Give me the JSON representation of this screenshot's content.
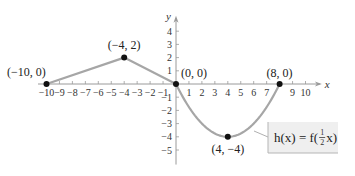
{
  "chart_data": {
    "type": "line",
    "title": "",
    "xlabel": "x",
    "ylabel": "y",
    "xlim": [
      -10.5,
      10.8
    ],
    "ylim": [
      -5.8,
      4.8
    ],
    "x_ticks": [
      -10,
      -9,
      -8,
      -7,
      -6,
      -5,
      -4,
      -3,
      -2,
      -1,
      1,
      2,
      3,
      4,
      5,
      6,
      7,
      9,
      10
    ],
    "x_tick_labels": [
      "−10",
      "−9",
      "−8",
      "−7",
      "−6",
      "−5",
      "−4",
      "−3",
      "−2",
      "−1",
      "1",
      "2",
      "3",
      "4",
      "5",
      "6",
      "7",
      "9",
      "10"
    ],
    "y_ticks": [
      4,
      3,
      2,
      1,
      -1,
      -2,
      -3,
      -4,
      -5
    ],
    "y_tick_labels": [
      "4",
      "3",
      "2",
      "1",
      "−1",
      "−2",
      "−3",
      "−4",
      "−5"
    ],
    "grid": false,
    "series": [
      {
        "name": "h(x) = f(½x)",
        "color": "#a6a6a6",
        "segments": [
          {
            "kind": "linear",
            "points": [
              [
                -10,
                0
              ],
              [
                -4,
                2
              ],
              [
                0,
                0
              ]
            ]
          },
          {
            "kind": "parabola",
            "points": [
              [
                0,
                0
              ],
              [
                4,
                -4
              ],
              [
                8,
                0
              ]
            ]
          }
        ]
      }
    ],
    "labeled_points": [
      {
        "x": -10,
        "y": 0,
        "label": "(−10, 0)"
      },
      {
        "x": -4,
        "y": 2,
        "label": "(−4, 2)"
      },
      {
        "x": 0,
        "y": 0,
        "label": "(0, 0)"
      },
      {
        "x": 8,
        "y": 0,
        "label": "(8, 0)"
      },
      {
        "x": 4,
        "y": -4,
        "label": "(4, −4)"
      }
    ],
    "annotation": {
      "text_prefix": "h(x) = f(",
      "frac_num": "1",
      "frac_den": "2",
      "text_suffix": "x)"
    }
  },
  "colors": {
    "curve": "#a6a6a6",
    "axis": "#9a9a9a",
    "point": "#111111",
    "label_box_fill": "#efefef",
    "label_box_shadow": "#b5b5b5"
  }
}
